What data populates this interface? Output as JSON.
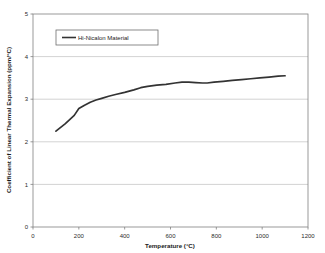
{
  "figure": {
    "background_color": "#ffffff",
    "plot_border_color": "#808080",
    "gridline_color": "#c0c0c0",
    "series_color": "#333333",
    "caption_partial": "Figure 4. Coefficient of"
  },
  "chart_data": {
    "type": "line",
    "title": "",
    "xlabel": "Temperature (°C)",
    "ylabel": "Coefficient of Linear Thermal Expansion (ppm/°C)",
    "xlim": [
      0,
      1200
    ],
    "ylim": [
      0,
      5
    ],
    "xticks": [
      0,
      200,
      400,
      600,
      800,
      1000,
      1200
    ],
    "yticks": [
      0,
      1,
      2,
      3,
      4,
      5
    ],
    "xtick_labels": [
      "0",
      "200",
      "400",
      "600",
      "800",
      "1000",
      "1200"
    ],
    "ytick_labels": [
      "0",
      "1",
      "2",
      "3",
      "4",
      "5"
    ],
    "grid": "horizontal",
    "legend_position": "upper-left-inside",
    "series": [
      {
        "name": "Hi-Nicalon Material",
        "color": "#333333",
        "x": [
          100,
          140,
          180,
          200,
          225,
          250,
          275,
          300,
          330,
          360,
          400,
          440,
          470,
          500,
          540,
          580,
          620,
          650,
          680,
          710,
          740,
          760,
          790,
          830,
          870,
          910,
          950,
          990,
          1030,
          1070,
          1100
        ],
        "y": [
          2.25,
          2.42,
          2.62,
          2.78,
          2.86,
          2.93,
          2.98,
          3.02,
          3.07,
          3.11,
          3.16,
          3.22,
          3.27,
          3.3,
          3.33,
          3.35,
          3.38,
          3.4,
          3.4,
          3.39,
          3.38,
          3.38,
          3.4,
          3.42,
          3.44,
          3.46,
          3.48,
          3.5,
          3.52,
          3.54,
          3.55
        ]
      }
    ]
  },
  "legend": {
    "entries": [
      {
        "label": "Hi-Nicalon Material",
        "color": "#333333"
      }
    ]
  }
}
